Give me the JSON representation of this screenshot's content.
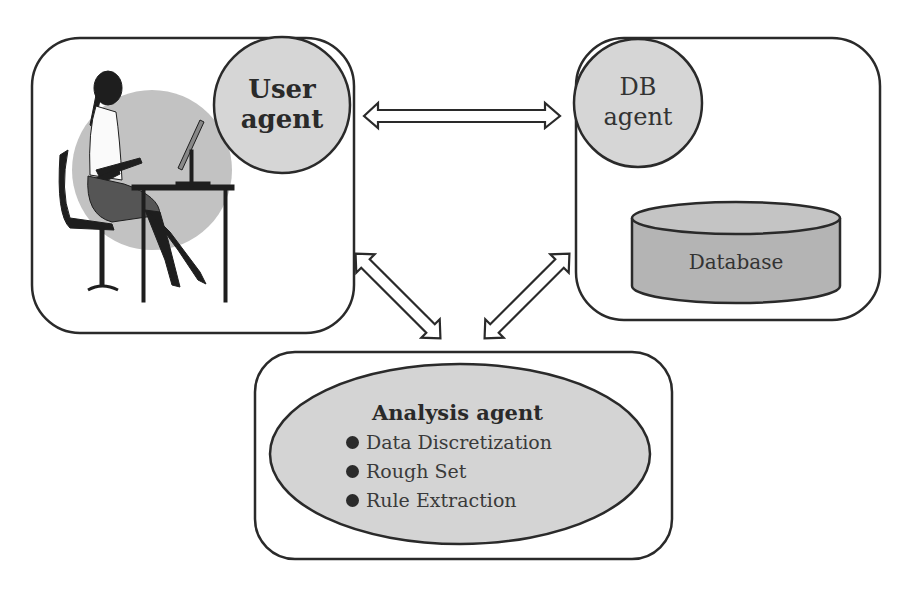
{
  "diagram": {
    "user_box": {
      "agent_label_line1": "User",
      "agent_label_line2": "agent",
      "figure": "person-at-computer-silhouette"
    },
    "db_box": {
      "agent_label_line1": "DB",
      "agent_label_line2": "agent",
      "database_label": "Database"
    },
    "analysis_box": {
      "title": "Analysis agent",
      "items": [
        "Data Discretization",
        "Rough Set",
        "Rule Extraction"
      ]
    },
    "connections": [
      {
        "from": "User agent",
        "to": "DB agent",
        "type": "bidirectional"
      },
      {
        "from": "User agent",
        "to": "Analysis agent",
        "type": "bidirectional"
      },
      {
        "from": "DB agent",
        "to": "Analysis agent",
        "type": "bidirectional"
      }
    ],
    "colors": {
      "stroke": "#2a2a2a",
      "agent_fill": "#d6d6d6",
      "database_fill": "#b4b4b4",
      "database_top": "#c4c4c4",
      "ellipse_fill": "#d4d4d4",
      "backdrop_circle": "#c2c2c2"
    }
  }
}
